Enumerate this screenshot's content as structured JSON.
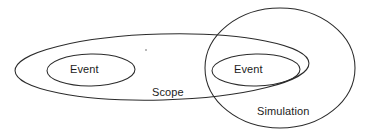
{
  "diagram": {
    "type": "venn-ellipse-diagram",
    "background_color": "#ffffff",
    "stroke_color": "#2b2b2b",
    "text_color": "#1c1c1c",
    "labels": {
      "event_left": "Event",
      "event_right": "Event",
      "scope": "Scope",
      "simulation": "Simulation"
    },
    "shapes": [
      {
        "name": "scope-ellipse",
        "label": "Scope",
        "kind": "ellipse",
        "cx": 162,
        "cy": 67,
        "rx": 147,
        "ry": 33,
        "rotation": -1.5
      },
      {
        "name": "simulation-ellipse",
        "label": "Simulation",
        "kind": "ellipse",
        "cx": 280,
        "cy": 68,
        "rx": 75,
        "ry": 60,
        "rotation": 0
      },
      {
        "name": "event-left-ellipse",
        "label": "Event",
        "kind": "ellipse",
        "cx": 91,
        "cy": 70,
        "rx": 44,
        "ry": 16,
        "rotation": -1
      },
      {
        "name": "event-right-ellipse",
        "label": "Event",
        "kind": "ellipse",
        "cx": 256,
        "cy": 70,
        "rx": 44,
        "ry": 16,
        "rotation": -1
      }
    ],
    "relationships": [
      "Event (left) is contained within Scope",
      "Event (right) is contained within both Scope and Simulation",
      "Scope and Simulation overlap"
    ]
  }
}
